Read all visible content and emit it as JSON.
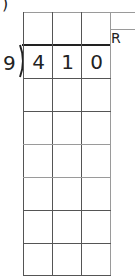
{
  "problem": {
    "label_paren": ")",
    "divisor": "9",
    "dividend_digits": [
      "4",
      "1",
      "0"
    ],
    "remainder_label": "R"
  },
  "grid": {
    "columns": 3,
    "rows": 7,
    "answer_row_cells": [
      "",
      "",
      ""
    ]
  }
}
